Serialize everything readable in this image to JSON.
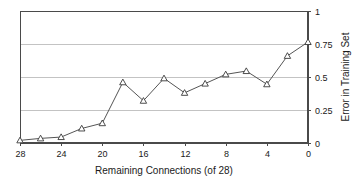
{
  "chart_data": {
    "type": "line",
    "title": "",
    "subtitle": "",
    "xlabel": "Remaining Connections (of 28)",
    "ylabel": "Error in Training Set",
    "x": [
      28,
      26,
      24,
      22,
      20,
      18,
      16,
      14,
      12,
      10,
      8,
      6,
      4,
      2,
      0
    ],
    "values": [
      0.02,
      0.035,
      0.045,
      0.11,
      0.15,
      0.46,
      0.32,
      0.49,
      0.38,
      0.45,
      0.52,
      0.545,
      0.445,
      0.66,
      0.765
    ],
    "series": [
      {
        "name": "Error in Training Set",
        "marker": "triangle-up",
        "values": [
          0.02,
          0.035,
          0.045,
          0.11,
          0.15,
          0.46,
          0.32,
          0.49,
          0.38,
          0.45,
          0.52,
          0.545,
          0.445,
          0.66,
          0.765
        ]
      }
    ],
    "xlim": [
      28,
      0
    ],
    "ylim": [
      0,
      1
    ],
    "x_ticks": [
      28,
      24,
      20,
      16,
      12,
      8,
      4,
      0
    ],
    "x_tick_labels": [
      "28",
      "24",
      "20",
      "16",
      "12",
      "8",
      "4",
      "0"
    ],
    "y_ticks": [
      0,
      0.25,
      0.5,
      0.75,
      1
    ],
    "y_tick_labels": [
      "0",
      "0.25",
      "0.5",
      "0.75",
      "1"
    ],
    "x_axis_inverted": true,
    "y_axis_position": "right",
    "grid": {
      "horizontal": true,
      "vertical": false
    },
    "legend": {
      "visible": false,
      "position": "none"
    },
    "colors": {
      "line": "#555555",
      "marker_fill": "#ffffff",
      "marker_stroke": "#3a3a3a",
      "grid": "#b4b4b4",
      "axis": "#4a4a4a",
      "text": "#1a1a1a",
      "background": "#ffffff"
    }
  }
}
